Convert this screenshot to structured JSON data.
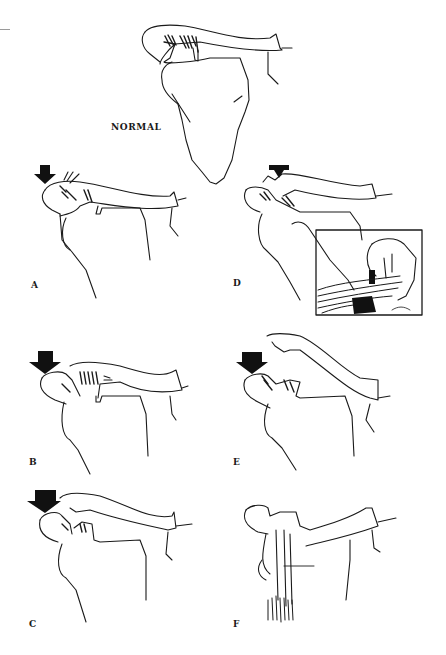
{
  "figure": {
    "panels": [
      {
        "id": "normal",
        "label": "NORMAL",
        "x": 111,
        "y": 119
      },
      {
        "id": "A",
        "label": "A",
        "x": 31,
        "y": 282
      },
      {
        "id": "B",
        "label": "B",
        "x": 29,
        "y": 455
      },
      {
        "id": "C",
        "label": "C",
        "x": 29,
        "y": 617
      },
      {
        "id": "D",
        "label": "D",
        "x": 233,
        "y": 280
      },
      {
        "id": "E",
        "label": "E",
        "x": 233,
        "y": 455
      },
      {
        "id": "F",
        "label": "F",
        "x": 233,
        "y": 617
      }
    ],
    "colors": {
      "ink": "#1a1a1a",
      "background": "#ffffff"
    }
  }
}
